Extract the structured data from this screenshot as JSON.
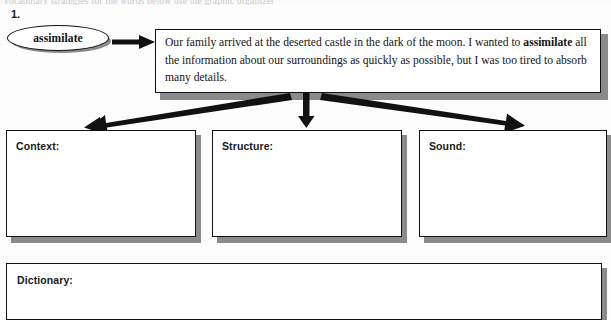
{
  "worksheet": {
    "clipped_header_text": "vocabulary strategies   for the words below     use the graphic organizer",
    "item_number": "1.",
    "vocabulary_word": "assimilate",
    "sentence": {
      "before_bold": "Our family arrived at the deserted castle in the dark of the moon. I wanted to ",
      "bold_word": "assimilate",
      "after_bold": " all the information about our surroundings as quickly as possible, but I was too tired to absorb many details."
    },
    "strategy_boxes": [
      {
        "label": "Context:",
        "value": ""
      },
      {
        "label": "Structure:",
        "value": ""
      },
      {
        "label": "Sound:",
        "value": ""
      }
    ],
    "dictionary_box": {
      "label": "Dictionary:",
      "value": ""
    },
    "colors": {
      "ink": "#111111",
      "shadow": "#8a8a8a",
      "paper": "#fdfdfd"
    },
    "icons": {
      "arrow_word_to_sentence": "arrow-right-icon",
      "arrow_to_context": "arrow-down-left-icon",
      "arrow_to_structure": "arrow-down-icon",
      "arrow_to_sound": "arrow-down-right-icon"
    }
  }
}
